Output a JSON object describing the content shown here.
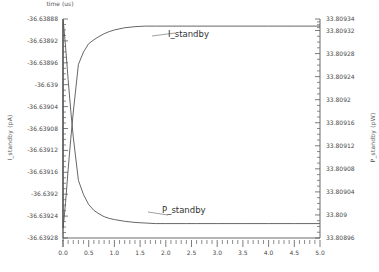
{
  "chart_data": {
    "type": "line",
    "title": "",
    "xlabel": "time (us)",
    "ylabel": "I_standby (pA)",
    "ylabel_right": "P_standby (pW)",
    "xlim": [
      0.0,
      5.0
    ],
    "ylim_left": [
      -36.63928,
      -36.63888
    ],
    "ylim_right": [
      33.80896,
      33.80934
    ],
    "grid": false,
    "legend_position": "inline-annotation",
    "xticks": [
      "0.0",
      "0.5",
      "1.0",
      "1.5",
      "2.0",
      "2.5",
      "3.0",
      "3.5",
      "4.0",
      "4.5",
      "5.0"
    ],
    "xtick_values": [
      0.0,
      0.5,
      1.0,
      1.5,
      2.0,
      2.5,
      3.0,
      3.5,
      4.0,
      4.5,
      5.0
    ],
    "yticks_left": [
      "-36.63888",
      "-36.63892",
      "-36.63896",
      "-36.639",
      "-36.63904",
      "-36.63908",
      "-36.63912",
      "-36.63916",
      "-36.6392",
      "-36.63924",
      "-36.63928"
    ],
    "ytick_values_left": [
      -36.63888,
      -36.63892,
      -36.63896,
      -36.639,
      -36.63904,
      -36.63908,
      -36.63912,
      -36.63916,
      -36.6392,
      -36.63924,
      -36.63928
    ],
    "yticks_right": [
      "33.80934",
      "33.80932",
      "33.80928",
      "33.80924",
      "33.8092",
      "33.80916",
      "33.80912",
      "33.80908",
      "33.80904",
      "33.809",
      "33.80896"
    ],
    "ytick_values_right": [
      33.80934,
      33.80932,
      33.80928,
      33.80924,
      33.8092,
      33.80916,
      33.80912,
      33.80908,
      33.80904,
      33.809,
      33.80896
    ],
    "line_color": "#555555",
    "series": [
      {
        "name": "I_standby",
        "axis": "left",
        "unit": "pA",
        "annotation": "I_standby",
        "start_value": -36.639262,
        "end_value": -36.638893,
        "x": [
          0.0,
          0.02,
          0.05,
          0.1,
          0.15,
          0.2,
          0.3,
          0.4,
          0.5,
          0.6,
          0.7,
          0.8,
          0.9,
          1.0,
          1.2,
          1.4,
          1.6,
          1.8,
          2.0,
          2.2,
          2.4,
          2.6,
          3.0,
          3.5,
          4.0,
          4.5,
          5.0
        ],
        "values": [
          -36.639262,
          -36.639245,
          -36.639215,
          -36.639155,
          -36.6391,
          -36.63905,
          -36.638963,
          -36.63894,
          -36.638925,
          -36.638918,
          -36.638912,
          -36.638907,
          -36.638903,
          -36.6389,
          -36.638896,
          -36.638894,
          -36.638893,
          -36.638893,
          -36.638893,
          -36.638893,
          -36.638893,
          -36.638893,
          -36.638893,
          -36.638893,
          -36.638893,
          -36.638893,
          -36.638893
        ]
      },
      {
        "name": "P_standby",
        "axis": "right",
        "unit": "pW",
        "annotation": "P_standby",
        "start_value": 33.80934,
        "end_value": 33.808985,
        "x": [
          0.0,
          0.02,
          0.05,
          0.1,
          0.15,
          0.2,
          0.3,
          0.4,
          0.5,
          0.6,
          0.7,
          0.8,
          0.9,
          1.0,
          1.2,
          1.4,
          1.6,
          1.8,
          2.0,
          2.2,
          2.4,
          2.6,
          3.0,
          3.5,
          4.0,
          4.5,
          5.0
        ],
        "values": [
          33.80934,
          33.809322,
          33.809292,
          33.809235,
          33.809182,
          33.809135,
          33.80906,
          33.809035,
          33.809018,
          33.809008,
          33.809002,
          33.808997,
          33.808994,
          33.808992,
          33.808989,
          33.808987,
          33.808986,
          33.808985,
          33.808985,
          33.808985,
          33.808985,
          33.808985,
          33.808985,
          33.808985,
          33.808985,
          33.808985,
          33.808985
        ]
      }
    ],
    "initial_transient": {
      "note": "Both traces begin with a near-vertical segment at t=0 spanning the full plot height",
      "I_standby_t0_top": -36.638885,
      "P_standby_t0_bottom": 33.808955
    }
  },
  "plot_geometry": {
    "left": 63,
    "right": 320,
    "top": 19,
    "bottom": 238
  }
}
